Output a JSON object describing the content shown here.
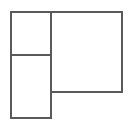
{
  "canvas": {
    "width": 130,
    "height": 129,
    "background_color": "#ffffff",
    "title": "Rectangle partition figure"
  },
  "style": {
    "stroke_color": "#5a5a5a",
    "stroke_width": 2,
    "fill_color": "#ffffff"
  },
  "diagram": {
    "type": "rectangle-partition",
    "shapes": [
      {
        "name": "top-left-rectangle",
        "x": 11,
        "y": 12,
        "width": 40,
        "height": 43,
        "label": ""
      },
      {
        "name": "bottom-left-rectangle",
        "x": 11,
        "y": 55,
        "width": 40,
        "height": 63,
        "label": ""
      },
      {
        "name": "right-rectangle",
        "x": 51,
        "y": 12,
        "width": 71,
        "height": 80,
        "label": ""
      }
    ]
  }
}
